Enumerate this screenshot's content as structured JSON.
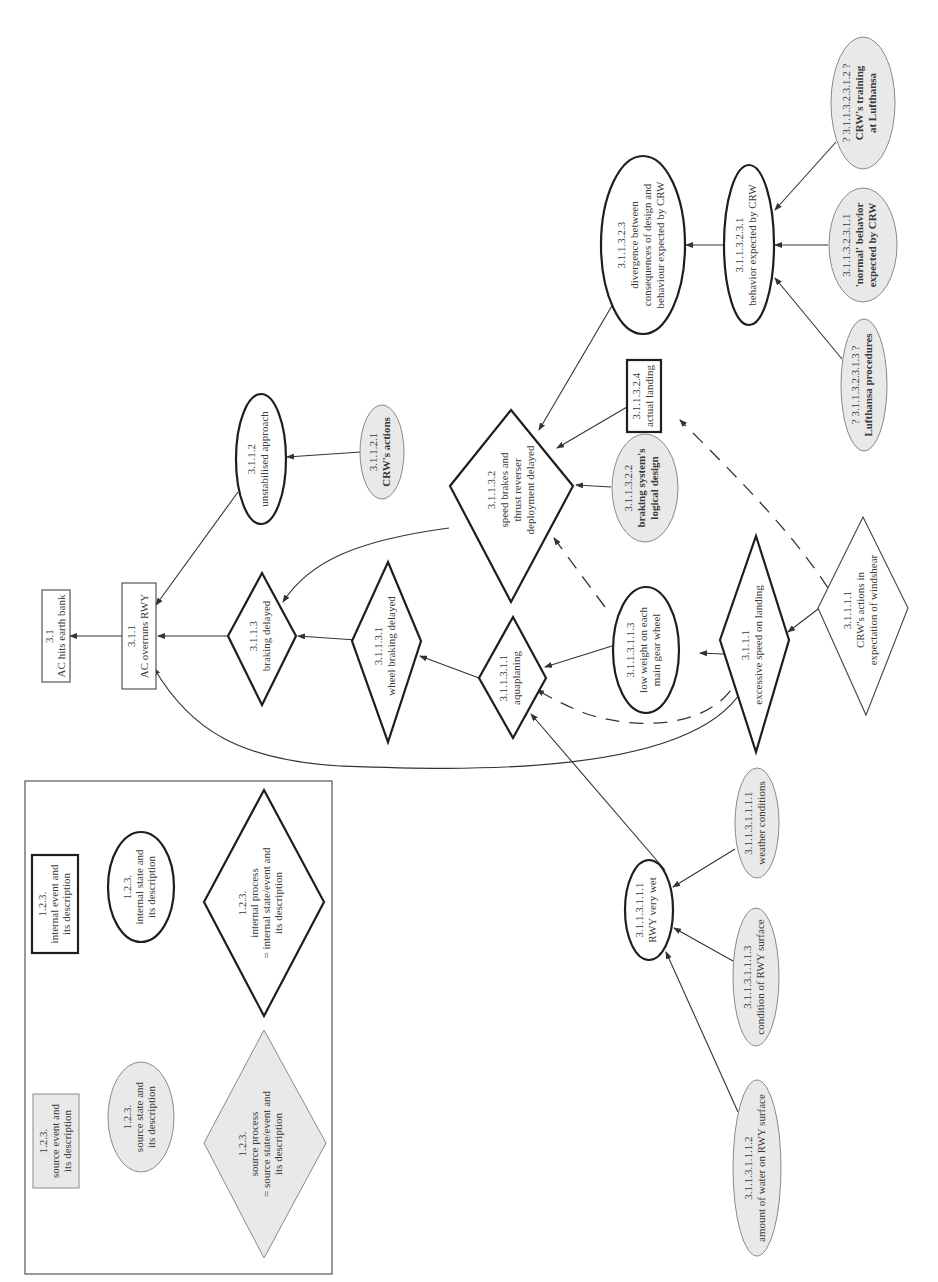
{
  "diagram": {
    "orientation": "rotated-90-ccw",
    "colors": {
      "internal_stroke": "#1e1e1e",
      "source_fill": "#e9e9e9",
      "source_stroke": "#8a8a8a",
      "text": "#3a3a3a"
    },
    "legend": {
      "internal_event": {
        "id": "1.2.3.",
        "l1": "internal event and",
        "l2": "its description"
      },
      "internal_state": {
        "id": "1.2.3.",
        "l1": "internal state and",
        "l2": "its description"
      },
      "internal_process": {
        "id": "1.2.3.",
        "l1": "internal process",
        "l2": "= internal state/event and",
        "l3": "its description"
      },
      "source_event": {
        "id": "1.2.3.",
        "l1": "source event and",
        "l2": "its description"
      },
      "source_state": {
        "id": "1.2.3.",
        "l1": "source state and",
        "l2": "its description"
      },
      "source_process": {
        "id": "1.2.3.",
        "l1": "source process",
        "l2": "= source state/event and",
        "l3": "its description"
      }
    },
    "nodes": {
      "n31": {
        "id": "3.1",
        "l1": "AC hits earth bank",
        "type": "internal-event-thin"
      },
      "n311": {
        "id": "3.1.1",
        "l1": "AC overruns RWY",
        "type": "internal-event-thin"
      },
      "n3112": {
        "id": "3.1.1.2",
        "l1": "unstabilised approach",
        "type": "internal-state"
      },
      "n31121": {
        "id": "3.1.1.2.1",
        "l1": "CRW's actions",
        "type": "source-state"
      },
      "n3113": {
        "id": "3.1.1.3",
        "l1": "braking delayed",
        "type": "internal-process"
      },
      "n31131": {
        "id": "3.1.1.3.1",
        "l1": "wheel braking delayed",
        "type": "internal-process"
      },
      "n311311": {
        "id": "3.1.1.3.1.1",
        "l1": "aquaplaning",
        "type": "internal-process"
      },
      "n3113111": {
        "id": "3.1.1.3.1.1.1",
        "l1": "RWY very wet",
        "type": "internal-state"
      },
      "n31131111": {
        "id": "3.1.1.3.1.1.1.1",
        "l1": "weather conditions",
        "type": "source-state"
      },
      "n31131113": {
        "id": "3.1.1.3.1.1.1.3",
        "l1": "condition of RWY surface",
        "type": "source-state"
      },
      "n31131112": {
        "id": "3.1.1.3.1.1.1.2",
        "l1": "amount of water on RWY surface",
        "type": "source-state"
      },
      "n3113113": {
        "id": "3.1.1.3.1.1.3",
        "l1": "low weight on each",
        "l2": "main gear wheel",
        "type": "internal-state"
      },
      "n3111": {
        "id": "3.1.1.1",
        "l1": "excessive speed on landing",
        "type": "internal-process"
      },
      "n31111": {
        "id": "3.1.1.1.1",
        "l1": "CRW's actions in",
        "l2": "expectation of windshear",
        "type": "internal-process-thin"
      },
      "n31132": {
        "id": "3.1.1.3.2",
        "l1": "speed brakes and",
        "l2": "thrust reverser",
        "l3": "deployment delayed",
        "type": "internal-process"
      },
      "n311322": {
        "id": "3.1.1.3.2.2",
        "l1": "braking system's",
        "l2": "logical design",
        "type": "source-state"
      },
      "n311324": {
        "id": "3.1.1.3.2.4",
        "l1": "actual landing",
        "type": "internal-event"
      },
      "n311323": {
        "id": "3.1.1.3.2.3",
        "l1": "divergence between",
        "l2": "consequences of design and",
        "l3": "behaviour expected by CRW",
        "type": "internal-state"
      },
      "n3113231": {
        "id": "3.1.1.3.2.3.1",
        "l1": "behavior expected by CRW",
        "type": "internal-state"
      },
      "n31132311": {
        "id": "3.1.1.3.2.3.1.1",
        "l1": "'normal' behavior",
        "l2": "expected by CRW",
        "type": "source-state"
      },
      "n31132312": {
        "id": "? 3.1.1.3.2.3.1.2 ?",
        "l1": "CRW's training",
        "l2": "at Lufthansa",
        "type": "source-state"
      },
      "n31132313": {
        "id": "? 3.1.1.3.2.3.1.3 ?",
        "l1": "Lufthansa procedures",
        "type": "source-state"
      }
    }
  }
}
